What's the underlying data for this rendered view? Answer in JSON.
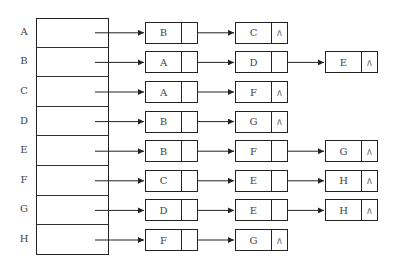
{
  "diagram": {
    "type": "adjacency-list",
    "vertices": [
      "A",
      "B",
      "C",
      "D",
      "E",
      "F",
      "G",
      "H"
    ],
    "null_symbol": "∧",
    "adjacency": [
      {
        "vertex": "A",
        "neighbors": [
          "B",
          "C"
        ]
      },
      {
        "vertex": "B",
        "neighbors": [
          "A",
          "D",
          "E"
        ]
      },
      {
        "vertex": "C",
        "neighbors": [
          "A",
          "F"
        ]
      },
      {
        "vertex": "D",
        "neighbors": [
          "B",
          "G"
        ]
      },
      {
        "vertex": "E",
        "neighbors": [
          "B",
          "F",
          "G"
        ]
      },
      {
        "vertex": "F",
        "neighbors": [
          "C",
          "E",
          "H"
        ]
      },
      {
        "vertex": "G",
        "neighbors": [
          "D",
          "E",
          "H"
        ]
      },
      {
        "vertex": "H",
        "neighbors": [
          "F",
          "G"
        ]
      }
    ]
  }
}
